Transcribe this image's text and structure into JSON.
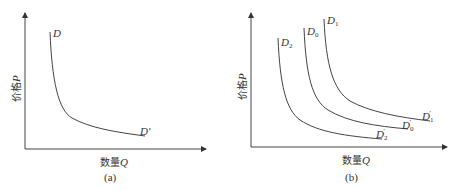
{
  "panels": [
    {
      "id": "a",
      "caption": "(a)",
      "x_axis": {
        "label_cn": "数量",
        "label_var": "Q"
      },
      "y_axis": {
        "label_cn": "价格",
        "label_var": "P"
      },
      "curves": [
        {
          "start_label": "D",
          "start_sub": "",
          "end_label": "D′",
          "end_sub": ""
        }
      ]
    },
    {
      "id": "b",
      "caption": "(b)",
      "x_axis": {
        "label_cn": "数量",
        "label_var": "Q"
      },
      "y_axis": {
        "label_cn": "价格",
        "label_var": "P"
      },
      "curves": [
        {
          "start_label": "D",
          "start_sub": "2",
          "end_label": "D",
          "end_sub": "2",
          "end_prime": "′"
        },
        {
          "start_label": "D",
          "start_sub": "0",
          "end_label": "D",
          "end_sub": "0",
          "end_prime": "′"
        },
        {
          "start_label": "D",
          "start_sub": "1",
          "end_label": "D",
          "end_sub": "1",
          "end_prime": "′"
        }
      ]
    }
  ],
  "colors": {
    "line": "#444444",
    "text": "#333333"
  }
}
